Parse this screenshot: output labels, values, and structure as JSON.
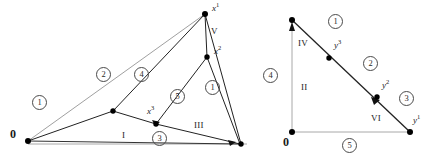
{
  "figure": {
    "background_color": "#ffffff",
    "stroke_dark": "#1a1a1a",
    "stroke_light": "#9a9a9a",
    "vertex_color": "#000000",
    "panels": [
      "left-simplex-diagram",
      "right-simplex-diagram"
    ]
  },
  "left_panel": {
    "origin_label": "0",
    "vertices": [
      {
        "name": "origin",
        "label": "0",
        "x": 28,
        "y": 141
      },
      {
        "name": "x1-apex",
        "label": "x",
        "sup": "1",
        "x": 205,
        "y": 14
      },
      {
        "name": "x2-point",
        "label": "x",
        "sup": "2",
        "x": 207,
        "y": 57
      },
      {
        "name": "x3-point",
        "label": "x",
        "sup": "3",
        "x": 156,
        "y": 124
      },
      {
        "name": "mid-left-node",
        "label": "",
        "sup": "",
        "x": 113,
        "y": 111
      },
      {
        "name": "bottom-right",
        "label": "",
        "sup": "",
        "x": 240,
        "y": 144
      }
    ],
    "point_labels": [
      {
        "name": "x1-label",
        "base": "x",
        "sup": "1",
        "x": 213,
        "y": 7
      },
      {
        "name": "x2-label",
        "base": "x",
        "sup": "2",
        "x": 215,
        "y": 50
      },
      {
        "name": "x3-label",
        "base": "x",
        "sup": "3",
        "x": 150,
        "y": 110
      }
    ],
    "roman_labels": [
      {
        "name": "roman-V",
        "text": "V",
        "x": 211,
        "y": 30
      },
      {
        "name": "roman-I",
        "text": "I",
        "x": 122,
        "y": 134
      },
      {
        "name": "roman-III",
        "text": "III",
        "x": 196,
        "y": 124
      }
    ],
    "circled_labels": [
      {
        "name": "circ-1-left",
        "text": "1",
        "x": 38,
        "y": 101
      },
      {
        "name": "circ-2",
        "text": "2",
        "x": 102,
        "y": 73
      },
      {
        "name": "circ-4",
        "text": "4",
        "x": 140,
        "y": 73
      },
      {
        "name": "circ-5",
        "text": "5",
        "x": 175,
        "y": 95
      },
      {
        "name": "circ-1-right",
        "text": "1",
        "x": 210,
        "y": 86
      },
      {
        "name": "circ-3",
        "text": "3",
        "x": 157,
        "y": 137
      }
    ]
  },
  "right_panel": {
    "origin_label": "0",
    "vertices": [
      {
        "name": "origin",
        "label": "0",
        "x": 34,
        "y": 132
      },
      {
        "name": "top-apex",
        "label": "",
        "sup": "",
        "x": 34,
        "y": 20
      },
      {
        "name": "y1-corner",
        "label": "y",
        "sup": "1",
        "x": 152,
        "y": 132
      },
      {
        "name": "y2-point",
        "label": "y",
        "sup": "2",
        "x": 119,
        "y": 97
      },
      {
        "name": "y3-point",
        "label": "y",
        "sup": "3",
        "x": 71,
        "y": 58
      }
    ],
    "point_labels": [
      {
        "name": "y3-label",
        "base": "y",
        "sup": "3",
        "x": 78,
        "y": 44
      },
      {
        "name": "y2-label",
        "base": "y",
        "sup": "2",
        "x": 126,
        "y": 84
      },
      {
        "name": "y1-label",
        "base": "y",
        "sup": "1",
        "x": 156,
        "y": 119
      }
    ],
    "roman_labels": [
      {
        "name": "roman-IV",
        "text": "IV",
        "x": 42,
        "y": 42
      },
      {
        "name": "roman-II",
        "text": "II",
        "x": 44,
        "y": 86
      },
      {
        "name": "roman-VI",
        "text": "VI",
        "x": 116,
        "y": 117
      }
    ],
    "circled_labels": [
      {
        "name": "circ-1",
        "text": "1",
        "x": 75,
        "y": 19
      },
      {
        "name": "circ-2",
        "text": "2",
        "x": 110,
        "y": 61
      },
      {
        "name": "circ-3",
        "text": "3",
        "x": 146,
        "y": 96
      },
      {
        "name": "circ-4",
        "text": "4",
        "x": 9,
        "y": 73
      },
      {
        "name": "circ-5",
        "text": "5",
        "x": 89,
        "y": 142
      }
    ]
  }
}
